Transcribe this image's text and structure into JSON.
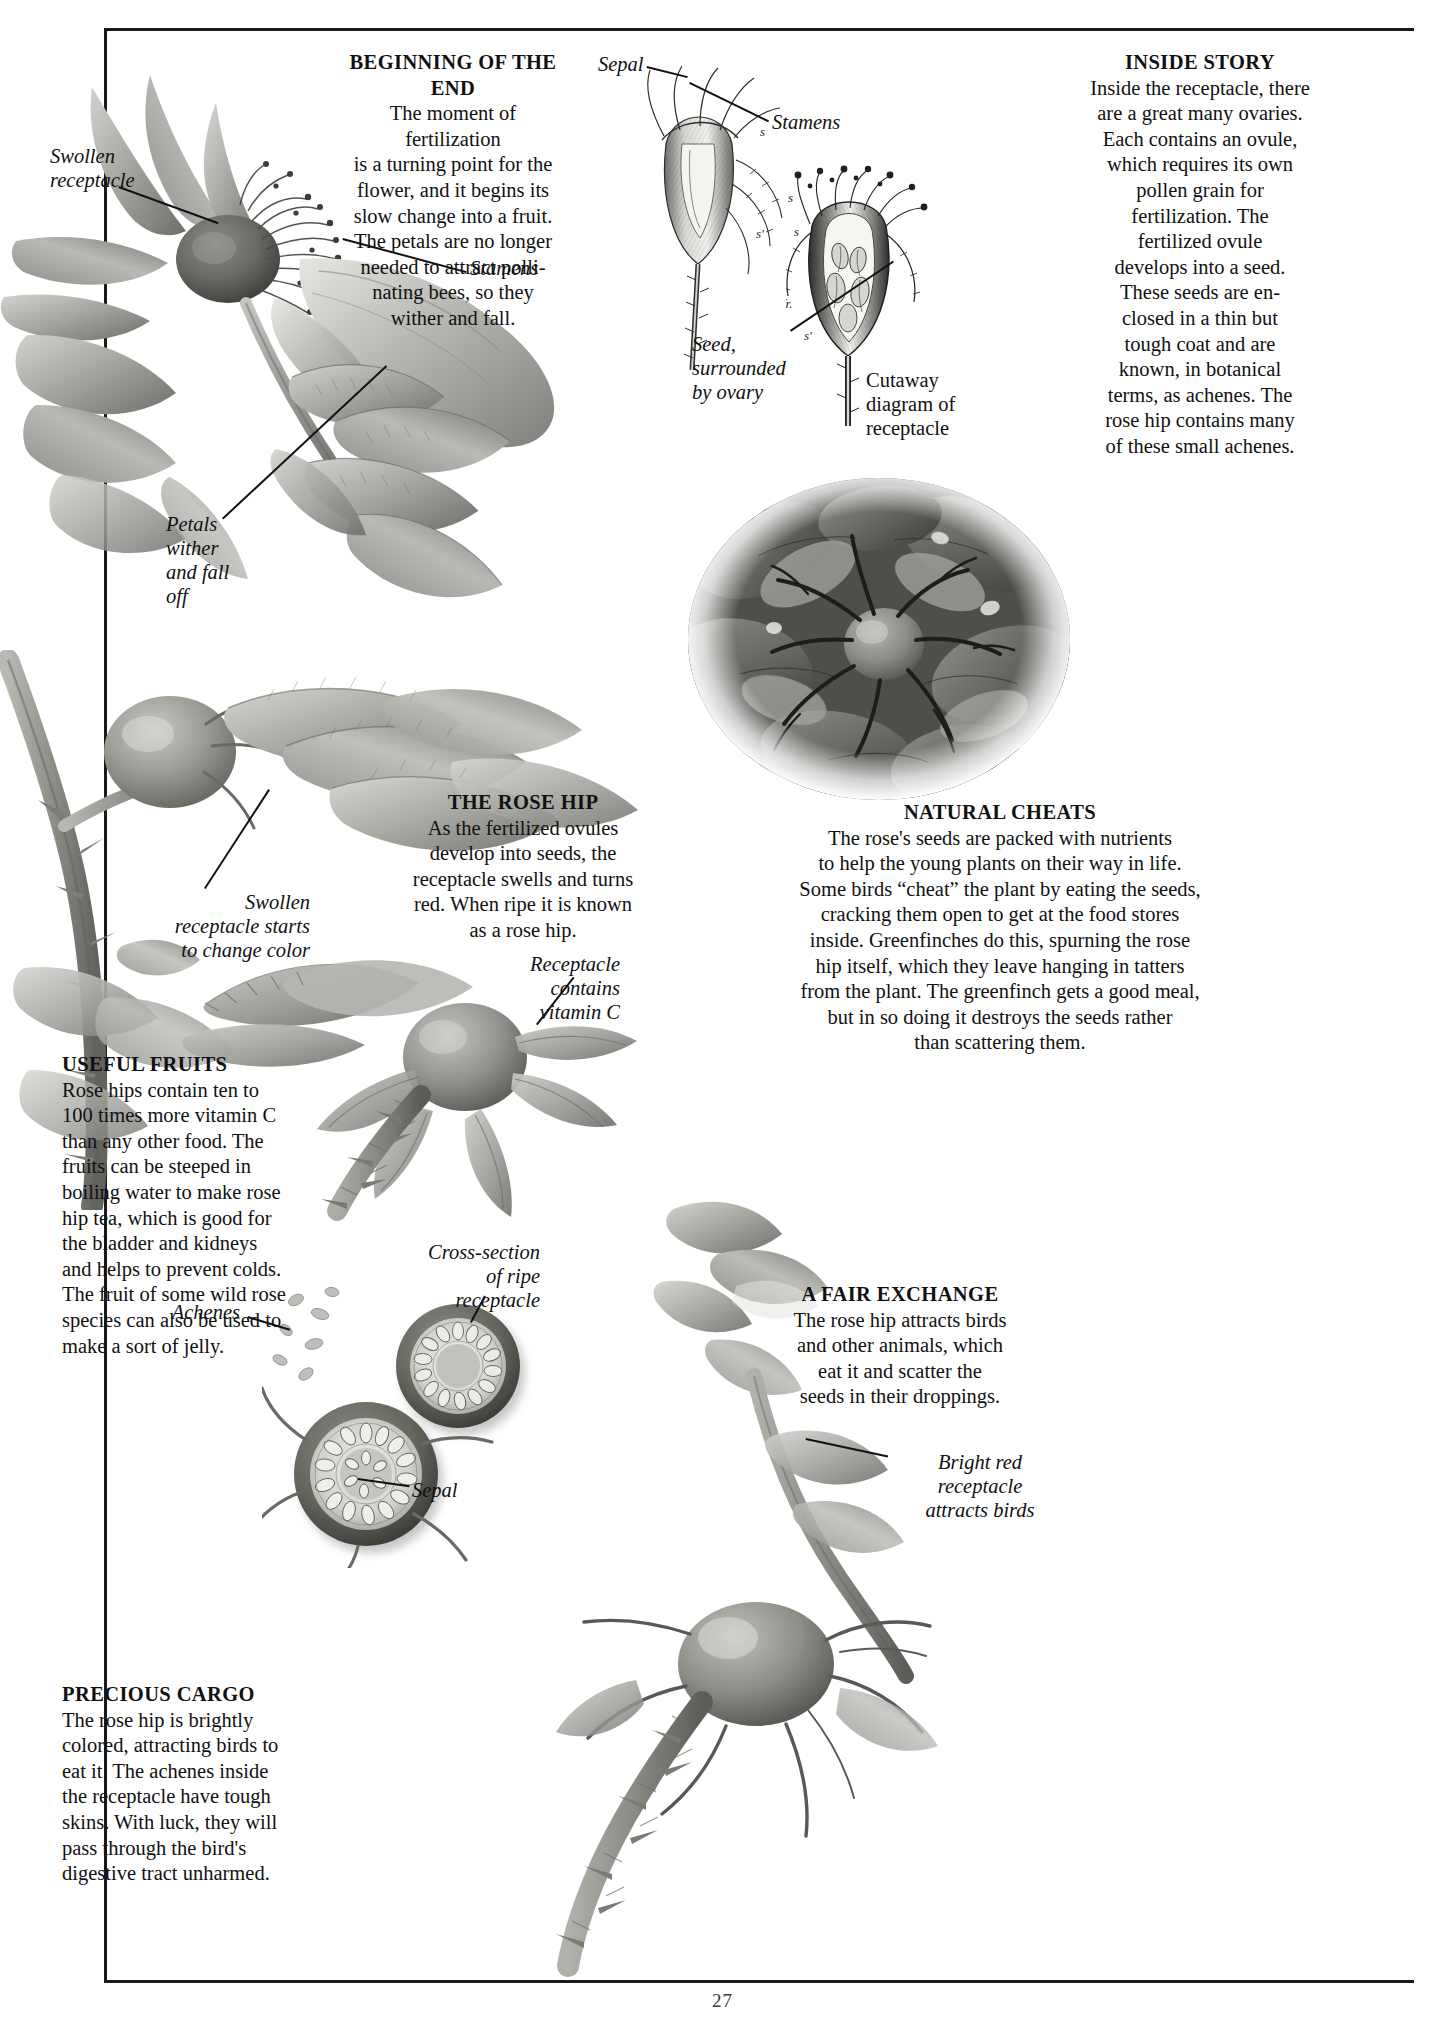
{
  "page": {
    "number": "27"
  },
  "blocks": {
    "beginning_of_the_end": {
      "heading": "BEGINNING OF THE END",
      "body": "The moment of fertilization is a turning point for the flower, and it begins its slow change into a fruit. The petals are no longer needed to attract polli-nating bees, so they wither and fall.",
      "lines": [
        "The moment of fertilization",
        "is a turning point for the",
        "flower, and it begins its",
        "slow change into a fruit.",
        "The petals are no longer",
        "needed to attract polli-",
        "nating bees, so they",
        "wither and fall."
      ]
    },
    "inside_story": {
      "heading": "INSIDE STORY",
      "lines": [
        "Inside the receptacle, there",
        "are a great many ovaries.",
        "Each contains an ovule,",
        "which requires its own",
        "pollen grain for",
        "fertilization. The",
        "fertilized ovule",
        "develops into a seed.",
        "These seeds are en-",
        "closed in a thin but",
        "tough coat and are",
        "known, in botanical",
        "terms, as  achenes. The",
        "rose hip contains many",
        "of these small achenes."
      ]
    },
    "the_rose_hip": {
      "heading": "THE ROSE HIP",
      "lines": [
        "As the fertilized ovules",
        "develop into seeds, the",
        "receptacle swells and turns",
        "red. When ripe it is known",
        "as a rose hip."
      ]
    },
    "natural_cheats": {
      "heading": "NATURAL CHEATS",
      "lines": [
        "The rose's seeds are packed with nutrients",
        "to help the young plants on their way in life.",
        "Some birds “cheat” the plant by eating the seeds,",
        "cracking them open to get at the food stores",
        "inside. Greenfinches do this, spurning the rose",
        "hip itself, which they leave hanging in tatters",
        "from the plant. The greenfinch gets a good meal,",
        "but in so doing it destroys the seeds rather",
        "than scattering them."
      ]
    },
    "useful_fruits": {
      "heading": "USEFUL FRUITS",
      "lines": [
        "Rose hips contain ten to",
        "100 times more vitamin C",
        "than any other food. The",
        "fruits  can be steeped in",
        "boiling water to make rose",
        "hip tea, which is good for",
        "the bladder and kidneys",
        "and helps to prevent colds.",
        "The fruit of some wild rose",
        "species can also be used to",
        "make a sort of jelly."
      ]
    },
    "precious_cargo": {
      "heading": "PRECIOUS CARGO",
      "lines": [
        "The rose hip is brightly",
        "colored, attracting birds to",
        "eat it. The achenes inside",
        "the receptacle have tough",
        "skins. With luck, they will",
        "pass through the bird's",
        "digestive tract unharmed."
      ]
    },
    "a_fair_exchange": {
      "heading": "A FAIR EXCHANGE",
      "lines": [
        "The rose hip attracts birds",
        "and other animals, which",
        "eat it and scatter the",
        "seeds in their droppings."
      ]
    }
  },
  "captions": {
    "swollen_receptacle": [
      "Swollen",
      "receptacle"
    ],
    "stamens_photo": "Stamens",
    "petals_wither": [
      "Petals",
      "wither",
      "and fall",
      "off"
    ],
    "sepal_top": "Sepal",
    "stamens_engraving": "Stamens",
    "seed_surrounded": [
      "Seed,",
      "surrounded",
      "by ovary"
    ],
    "cutaway": [
      "Cutaway",
      "diagram of",
      "receptacle"
    ],
    "swollen_starts": [
      "Swollen",
      "receptacle starts",
      "to change color"
    ],
    "receptacle_vitc": [
      "Receptacle",
      "contains",
      "vitamin C"
    ],
    "cross_section": [
      "Cross-section",
      "of ripe",
      "receptacle"
    ],
    "achenes": "Achenes",
    "sepal_bottom": "Sepal",
    "bright_red": [
      "Bright red",
      "receptacle",
      "attracts birds"
    ]
  },
  "engraving_marks": {
    "stamen_mark": "s",
    "style_mark": "s'",
    "fruit_mark": "fr.",
    "ovary_mark": "s'",
    "upper_mark": "s"
  },
  "palette": {
    "ink": "#111111",
    "paper": "#ffffff",
    "leaf_mid": "#9a9a96",
    "leaf_dark": "#5d5d5a",
    "leaf_light": "#c8c8c4",
    "hip_body": "#8f8f8a",
    "hip_dark": "#5a5a56",
    "engrave": "#3a3a38"
  }
}
